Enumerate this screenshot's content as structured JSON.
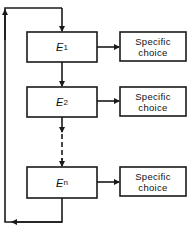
{
  "diagram": {
    "type": "flowchart",
    "colors": {
      "line": "#1a1a1a",
      "background": "#ffffff"
    },
    "stages": [
      {
        "id": "E1",
        "letter": "E",
        "subscript": "1",
        "output": "Specific choice"
      },
      {
        "id": "E2",
        "letter": "E",
        "subscript": "2",
        "output": "Specific choice"
      },
      {
        "id": "En",
        "letter": "E",
        "subscript": "n",
        "output": "Specific choice"
      }
    ],
    "choice_lines": {
      "0": [
        "Specific",
        "choice"
      ],
      "1": [
        "Specific",
        "choice"
      ],
      "2": [
        "Specific",
        "choice"
      ]
    },
    "connections": [
      {
        "from": "E1",
        "to": "E2",
        "style": "solid"
      },
      {
        "from": "E2",
        "to": "En",
        "style": "dashed"
      },
      {
        "from": "En",
        "to": "E1",
        "style": "feedback-loop"
      },
      {
        "from": "E1",
        "to": "choice-1",
        "style": "solid"
      },
      {
        "from": "E2",
        "to": "choice-2",
        "style": "solid"
      },
      {
        "from": "En",
        "to": "choice-n",
        "style": "solid"
      }
    ]
  }
}
